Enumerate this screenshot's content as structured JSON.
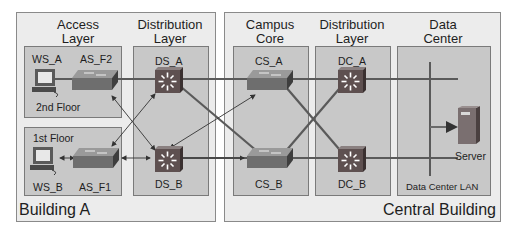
{
  "buildings": [
    {
      "name": "Building A"
    },
    {
      "name": "Central Building"
    }
  ],
  "layers": {
    "access": "Access Layer",
    "access_l1": "Access",
    "access_l2": "Layer",
    "dist_a_l1": "Distribution",
    "dist_a_l2": "Layer",
    "core_l1": "Campus",
    "core_l2": "Core",
    "dist_c_l1": "Distribution",
    "dist_c_l2": "Layer",
    "dc_l1": "Data",
    "dc_l2": "Center"
  },
  "floors": {
    "floor2": "2nd Floor",
    "floor1": "1st Floor"
  },
  "devices": {
    "ws_a": "WS_A",
    "as_f2": "AS_F2",
    "ws_b": "WS_B",
    "as_f1": "AS_F1",
    "ds_a": "DS_A",
    "ds_b": "DS_B",
    "cs_a": "CS_A",
    "cs_b": "CS_B",
    "dc_a": "DC_A",
    "dc_b": "DC_B",
    "server": "Server"
  },
  "dc_lan": "Data Center LAN",
  "colors": {
    "building_bg": "#ececec",
    "zone_bg": "#c8c8c8",
    "link": "#5a5a5a",
    "switch_body": "#6e6e6e",
    "multilayer_switch": "#5e5050",
    "server": "#7a6f70"
  }
}
